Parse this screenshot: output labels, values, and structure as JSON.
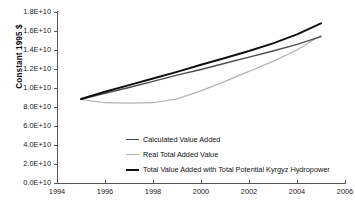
{
  "chart_data": {
    "type": "line",
    "title": "",
    "xlabel": "",
    "ylabel": "Constant 1995 $",
    "xlim": [
      1994,
      2006
    ],
    "ylim": [
      0,
      18000000000
    ],
    "grid": false,
    "legend_position": "inside-bottom-center",
    "x_tick_labels": [
      "1994",
      "1996",
      "1998",
      "2000",
      "2002",
      "2004",
      "2006"
    ],
    "x_ticks": [
      1994,
      1996,
      1998,
      2000,
      2002,
      2004,
      2006
    ],
    "y_tick_labels": [
      "0.0E+10",
      "2.0E+10",
      "4.0E+10",
      "6.0E+10",
      "8.0E+10",
      "1.0E+10",
      "1.2E+10",
      "1.4E+10",
      "1.6E+10",
      "1.8E+10"
    ],
    "y_ticks": [
      0,
      2000000000,
      4000000000,
      6000000000,
      8000000000,
      10000000000,
      12000000000,
      14000000000,
      16000000000,
      18000000000
    ],
    "x": [
      1995,
      1996,
      1997,
      1998,
      1999,
      2000,
      2001,
      2002,
      2003,
      2004,
      2005
    ],
    "series": [
      {
        "name": "Calculated Value Added",
        "color": "#4d4d4d",
        "width": 1.4,
        "values": [
          8800000000,
          9450000000,
          10050000000,
          10700000000,
          11350000000,
          11950000000,
          12600000000,
          13250000000,
          13900000000,
          14600000000,
          15400000000
        ]
      },
      {
        "name": "Real Total Added Value",
        "color": "#b3b3b3",
        "width": 1.2,
        "values": [
          8800000000,
          8450000000,
          8400000000,
          8450000000,
          8850000000,
          9700000000,
          10700000000,
          11750000000,
          12800000000,
          14000000000,
          15550000000
        ]
      },
      {
        "name": "Total Value Added with Total Potential Kyrgyz Hydropower",
        "color": "#111111",
        "width": 2.0,
        "values": [
          8850000000,
          9600000000,
          10300000000,
          11000000000,
          11700000000,
          12450000000,
          13150000000,
          13900000000,
          14700000000,
          15650000000,
          16800000000
        ]
      }
    ]
  },
  "axes": {
    "y_axis_title": "Constant 1995 $"
  },
  "legend": {
    "items": [
      {
        "label": "Calculated Value Added",
        "color": "#4d4d4d"
      },
      {
        "label": "Real Total Added Value",
        "color": "#b3b3b3"
      },
      {
        "label": "Total Value Added with Total Potential Kyrgyz Hydropower",
        "color": "#111111"
      }
    ]
  }
}
